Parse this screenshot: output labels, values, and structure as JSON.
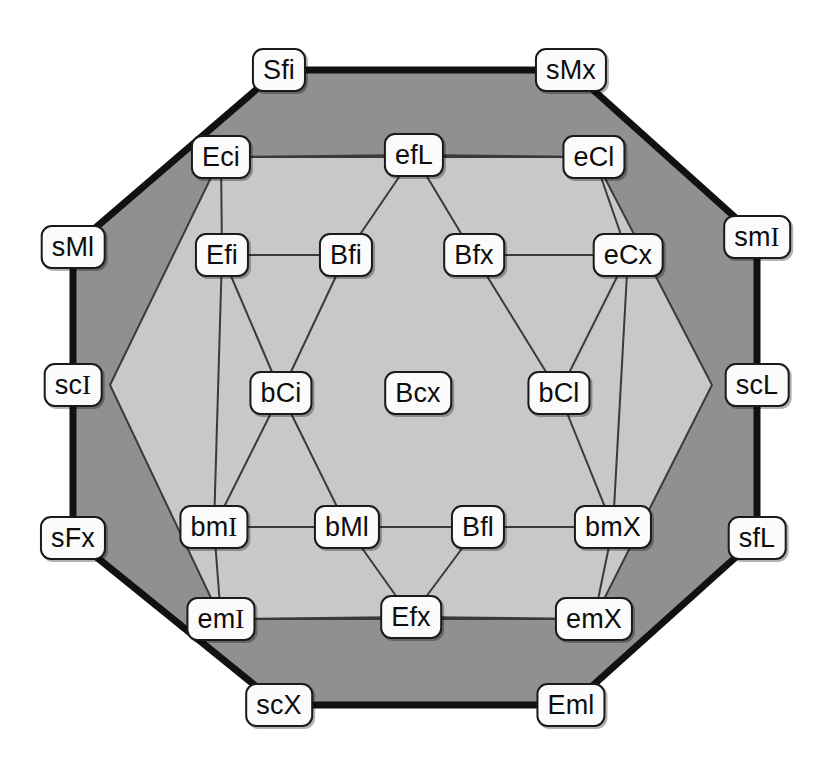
{
  "diagram": {
    "type": "node-link-diagram",
    "canvas": {
      "width": 831,
      "height": 777
    },
    "colors": {
      "background": "#ffffff",
      "outer_ring_fill": "#909090",
      "inner_region_fill": "#c8c8c8",
      "outer_border": "#111111",
      "inner_border": "#333333",
      "node_fill": "#fbfbfb",
      "node_border": "#1a1a1a",
      "text": "#0d0d0d"
    },
    "shapes": {
      "outer_octagon": {
        "name": "outer-octagon",
        "fill": "#909090",
        "stroke": "#111111",
        "stroke_width": 7,
        "points": "279,70 571,70 757,237 757,538 571,705 279,705 73,538 73,247"
      },
      "inner_hexagon": {
        "name": "inner-hexagon",
        "fill": "#c8c8c8",
        "stroke": "#3a3a3a",
        "stroke_width": 2,
        "points": "221,157 594,157 712,385 594,619 221,619 110,385"
      }
    },
    "nodes": [
      {
        "id": "Sfi",
        "label": "Sfi",
        "x": 279,
        "y": 70,
        "ring": "outer"
      },
      {
        "id": "sMx",
        "label": "sMx",
        "x": 571,
        "y": 70,
        "ring": "outer"
      },
      {
        "id": "smI",
        "label": "smI",
        "x": 757,
        "y": 237,
        "ring": "outer"
      },
      {
        "id": "scL",
        "label": "scL",
        "x": 757,
        "y": 385,
        "ring": "outer"
      },
      {
        "id": "sfL",
        "label": "sfL",
        "x": 757,
        "y": 538,
        "ring": "outer"
      },
      {
        "id": "Eml",
        "label": "Eml",
        "x": 571,
        "y": 705,
        "ring": "outer"
      },
      {
        "id": "scX",
        "label": "scX",
        "x": 279,
        "y": 705,
        "ring": "outer"
      },
      {
        "id": "sFx",
        "label": "sFx",
        "x": 73,
        "y": 538,
        "ring": "outer"
      },
      {
        "id": "scI",
        "label": "scI",
        "x": 73,
        "y": 385,
        "ring": "outer"
      },
      {
        "id": "sMl",
        "label": "sMl",
        "x": 73,
        "y": 247,
        "ring": "outer"
      },
      {
        "id": "Eci",
        "label": "Eci",
        "x": 221,
        "y": 157,
        "ring": "middle"
      },
      {
        "id": "efL",
        "label": "efL",
        "x": 414,
        "y": 155,
        "ring": "middle"
      },
      {
        "id": "eCl",
        "label": "eCl",
        "x": 594,
        "y": 157,
        "ring": "middle"
      },
      {
        "id": "eCx",
        "label": "eCx",
        "x": 628,
        "y": 255,
        "ring": "middle"
      },
      {
        "id": "bmX",
        "label": "bmX",
        "x": 613,
        "y": 527,
        "ring": "middle"
      },
      {
        "id": "emX",
        "label": "emX",
        "x": 594,
        "y": 619,
        "ring": "middle"
      },
      {
        "id": "Efx",
        "label": "Efx",
        "x": 411,
        "y": 617,
        "ring": "middle"
      },
      {
        "id": "emI",
        "label": "emI",
        "x": 221,
        "y": 619,
        "ring": "middle"
      },
      {
        "id": "bmI",
        "label": "bmI",
        "x": 214,
        "y": 527,
        "ring": "middle"
      },
      {
        "id": "Efi",
        "label": "Efi",
        "x": 222,
        "y": 255,
        "ring": "middle"
      },
      {
        "id": "Bfi",
        "label": "Bfi",
        "x": 346,
        "y": 255,
        "ring": "inner"
      },
      {
        "id": "Bfx",
        "label": "Bfx",
        "x": 474,
        "y": 255,
        "ring": "inner"
      },
      {
        "id": "bCl",
        "label": "bCl",
        "x": 559,
        "y": 393,
        "ring": "inner"
      },
      {
        "id": "Bfl",
        "label": "Bfl",
        "x": 478,
        "y": 527,
        "ring": "inner"
      },
      {
        "id": "bMl",
        "label": "bMl",
        "x": 347,
        "y": 527,
        "ring": "inner"
      },
      {
        "id": "bCi",
        "label": "bCi",
        "x": 281,
        "y": 393,
        "ring": "inner"
      },
      {
        "id": "Bcx",
        "label": "Bcx",
        "x": 418,
        "y": 393,
        "ring": "center"
      }
    ],
    "edges": [
      {
        "from": "Sfi",
        "to": "sMx",
        "style": "thick"
      },
      {
        "from": "sMx",
        "to": "smI",
        "style": "thick"
      },
      {
        "from": "smI",
        "to": "scL",
        "style": "thick"
      },
      {
        "from": "scL",
        "to": "sfL",
        "style": "thick"
      },
      {
        "from": "sfL",
        "to": "Eml",
        "style": "thick"
      },
      {
        "from": "Eml",
        "to": "scX",
        "style": "thick"
      },
      {
        "from": "scX",
        "to": "sFx",
        "style": "thick"
      },
      {
        "from": "sFx",
        "to": "scI",
        "style": "thick"
      },
      {
        "from": "scI",
        "to": "sMl",
        "style": "thick"
      },
      {
        "from": "sMl",
        "to": "Sfi",
        "style": "thick"
      },
      {
        "from": "Eci",
        "to": "efL",
        "style": "thin"
      },
      {
        "from": "efL",
        "to": "eCl",
        "style": "thin"
      },
      {
        "from": "eCl",
        "to": "eCx",
        "style": "thin"
      },
      {
        "from": "eCx",
        "to": "bmX",
        "style": "thin"
      },
      {
        "from": "bmX",
        "to": "emX",
        "style": "thin"
      },
      {
        "from": "emX",
        "to": "Efx",
        "style": "thin"
      },
      {
        "from": "Efx",
        "to": "emI",
        "style": "thin"
      },
      {
        "from": "emI",
        "to": "bmI",
        "style": "thin"
      },
      {
        "from": "bmI",
        "to": "Efi",
        "style": "thin"
      },
      {
        "from": "Efi",
        "to": "Eci",
        "style": "thin"
      },
      {
        "from": "Efi",
        "to": "Bfi",
        "style": "thin"
      },
      {
        "from": "Bfx",
        "to": "eCx",
        "style": "thin"
      },
      {
        "from": "bmI",
        "to": "bMl",
        "style": "thin"
      },
      {
        "from": "bMl",
        "to": "Bfl",
        "style": "thin"
      },
      {
        "from": "Bfl",
        "to": "bmX",
        "style": "thin"
      },
      {
        "from": "efL",
        "to": "Bfi",
        "style": "thin"
      },
      {
        "from": "efL",
        "to": "Bfx",
        "style": "thin"
      },
      {
        "from": "Bfi",
        "to": "bCi",
        "style": "thin"
      },
      {
        "from": "Efi",
        "to": "bCi",
        "style": "thin"
      },
      {
        "from": "bCi",
        "to": "bmI",
        "style": "thin"
      },
      {
        "from": "bCi",
        "to": "bMl",
        "style": "thin"
      },
      {
        "from": "Bfx",
        "to": "bCl",
        "style": "thin"
      },
      {
        "from": "eCx",
        "to": "bCl",
        "style": "thin"
      },
      {
        "from": "bCl",
        "to": "bmX",
        "style": "thin"
      },
      {
        "from": "bMl",
        "to": "Efx",
        "style": "thin"
      },
      {
        "from": "Bfl",
        "to": "Efx",
        "style": "thin"
      }
    ]
  }
}
